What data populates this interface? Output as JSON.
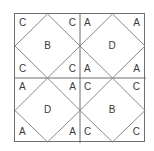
{
  "figure": {
    "title": "",
    "background_color": "#ffffff",
    "frame_color": "#6e6e6e",
    "diamond_line_color": "#8a8a8a",
    "letter_color": "#3a3a3a",
    "grid_rows": 2,
    "grid_cols": 2,
    "quadrants": [
      {
        "position": "top-left",
        "center": "B",
        "corners": {
          "top_left": "C",
          "top_right": "C",
          "bottom_left": "C",
          "bottom_right": "C"
        }
      },
      {
        "position": "top-right",
        "center": "D",
        "corners": {
          "top_left": "A",
          "top_right": "A",
          "bottom_left": "A",
          "bottom_right": "A"
        }
      },
      {
        "position": "bottom-left",
        "center": "D",
        "corners": {
          "top_left": "A",
          "top_right": "A",
          "bottom_left": "A",
          "bottom_right": "A"
        }
      },
      {
        "position": "bottom-right",
        "center": "B",
        "corners": {
          "top_left": "C",
          "top_right": "C",
          "bottom_left": "C",
          "bottom_right": "C"
        }
      }
    ]
  }
}
